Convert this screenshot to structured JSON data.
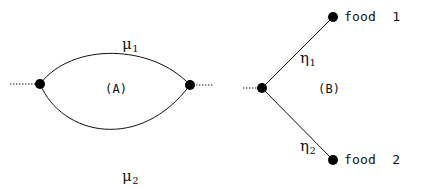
{
  "figure": {
    "background_color": "#ffffff",
    "stroke_color": "#111111",
    "node_color": "#000000",
    "width": 427,
    "height": 189
  },
  "panels": [
    {
      "id": "A",
      "tag": "(A)",
      "tag_position": {
        "x": 117,
        "y": 90
      },
      "description": "two nodes joined by two parallel curved edges",
      "nodes": [
        {
          "name": "left-node",
          "x": 40,
          "y": 84,
          "r": 5
        },
        {
          "name": "right-node",
          "x": 190,
          "y": 85,
          "r": 5
        }
      ],
      "stubs": [
        {
          "name": "left-stub",
          "x1": 10,
          "y1": 84,
          "x2": 40,
          "y2": 84,
          "style": "dotted"
        },
        {
          "name": "right-stub",
          "x1": 190,
          "y1": 85,
          "x2": 213,
          "y2": 85,
          "style": "dotted"
        }
      ],
      "edges": [
        {
          "name": "upper-arc",
          "label": "μ",
          "subscript": "1",
          "label_position": {
            "x": 103,
            "y": 22
          },
          "path": "M 40 84 C 72 42, 152 44, 190 85"
        },
        {
          "name": "lower-arc",
          "label": "μ",
          "subscript": "2",
          "label_position": {
            "x": 103,
            "y": 154
          },
          "path": "M 40 84 C 62 136, 140 152, 190 85"
        }
      ]
    },
    {
      "id": "B",
      "tag": "(B)",
      "tag_position": {
        "x": 330,
        "y": 90
      },
      "description": "one node branching to two food nodes",
      "nodes": [
        {
          "name": "center-node",
          "x": 262,
          "y": 88,
          "r": 5
        },
        {
          "name": "food-1-node",
          "x": 333,
          "y": 17,
          "r": 5
        },
        {
          "name": "food-2-node",
          "x": 333,
          "y": 160,
          "r": 5
        }
      ],
      "stubs": [
        {
          "name": "left-stub",
          "x1": 243,
          "y1": 88,
          "x2": 262,
          "y2": 88,
          "style": "dotted"
        }
      ],
      "edges": [
        {
          "name": "upper-branch",
          "label": "η",
          "subscript": "1",
          "label_position": {
            "x": 281,
            "y": 36
          },
          "path": "M 262 88 L 333 17"
        },
        {
          "name": "lower-branch",
          "label": "η",
          "subscript": "2",
          "label_position": {
            "x": 281,
            "y": 124
          },
          "path": "M 262 88 L 333 160"
        }
      ],
      "leaf_labels": [
        {
          "name": "food-1-label",
          "text": "food  1",
          "x": 344,
          "y": 10
        },
        {
          "name": "food-2-label",
          "text": "food  2",
          "x": 344,
          "y": 153
        }
      ]
    }
  ]
}
